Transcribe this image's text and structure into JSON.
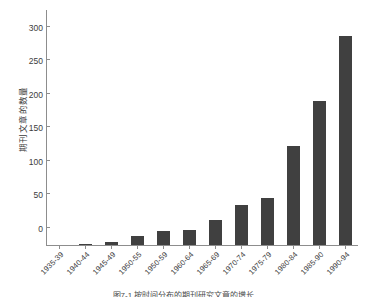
{
  "chart_data": {
    "type": "bar",
    "title": "",
    "xlabel": "",
    "ylabel": "期刊文章的数量",
    "ylim": [
      0,
      350
    ],
    "yticks": [
      0,
      50,
      100,
      150,
      200,
      250,
      300,
      350
    ],
    "grid": false,
    "legend": null,
    "bar_color": "#404040",
    "categories": [
      "1935-39",
      "1940-44",
      "1945-49",
      "1950-55",
      "1950-59",
      "1960-64",
      "1965-69",
      "1970-74",
      "1975-79",
      "1980-84",
      "1985-90",
      "1990-94"
    ],
    "values": [
      0,
      1,
      4,
      13,
      21,
      23,
      38,
      60,
      70,
      147,
      215,
      312
    ]
  },
  "caption": {
    "text": "图7-1 按时间分布的期刊研究文章的增长"
  }
}
